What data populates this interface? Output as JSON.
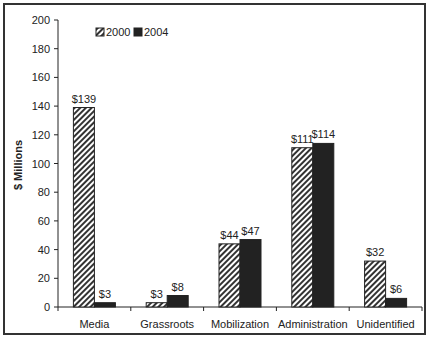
{
  "chart_data": {
    "type": "bar",
    "title": "",
    "xlabel": "",
    "ylabel": "$ Millions",
    "ylim": [
      0,
      200
    ],
    "yticks": [
      0,
      20,
      40,
      60,
      80,
      100,
      120,
      140,
      160,
      180,
      200
    ],
    "grid": false,
    "legend_position": "top-left inside",
    "categories": [
      "Media",
      "Grassroots",
      "Mobilization",
      "Administration",
      "Unidentified"
    ],
    "series": [
      {
        "name": "2000",
        "pattern": "diagonal-hatch",
        "values": [
          139,
          3,
          44,
          111,
          32
        ],
        "labels": [
          "$139",
          "$3",
          "$44",
          "$111",
          "$32"
        ]
      },
      {
        "name": "2004",
        "pattern": "solid-dark",
        "color": "#222222",
        "values": [
          3,
          8,
          47,
          114,
          6
        ],
        "labels": [
          "$3",
          "$8",
          "$47",
          "$114",
          "$6"
        ]
      }
    ]
  }
}
